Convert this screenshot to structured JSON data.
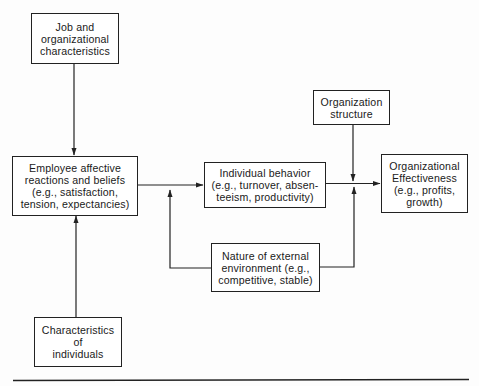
{
  "diagram": {
    "nodes": {
      "job_org": {
        "label": "Job and\norganizational\ncharacteristics"
      },
      "employee": {
        "label": "Employee affective\nreactions and beliefs\n(e.g., satisfaction,\ntension, expectancies)"
      },
      "individual_behavior": {
        "label": "Individual behavior\n(e.g., turnover, absen-\nteeism, productivity)"
      },
      "org_structure": {
        "label": "Organization\nstructure"
      },
      "org_effectiveness": {
        "label": "Organizational\nEffectiveness\n(e.g., profits,\ngrowth)"
      },
      "external_env": {
        "label": "Nature of external\nenvironment (e.g.,\ncompetitive, stable)"
      },
      "individual_chars": {
        "label": "Characteristics\nof\nindividuals"
      }
    },
    "edges": [
      {
        "from": "job_org",
        "to": "employee"
      },
      {
        "from": "individual_chars",
        "to": "employee"
      },
      {
        "from": "employee",
        "to": "individual_behavior"
      },
      {
        "from": "external_env",
        "to": "employee-to-individual_behavior-link"
      },
      {
        "from": "individual_behavior",
        "to": "org_effectiveness"
      },
      {
        "from": "org_structure",
        "to": "individual_behavior-to-org_effectiveness-link"
      },
      {
        "from": "external_env",
        "to": "individual_behavior-to-org_effectiveness-link"
      }
    ],
    "colors": {
      "line": "#222222",
      "background": "#fdfdfd"
    }
  }
}
